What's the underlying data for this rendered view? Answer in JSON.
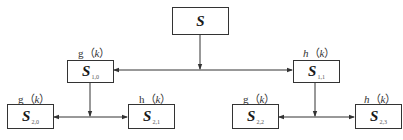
{
  "diagram": {
    "type": "wavelet-packet-decomposition-tree",
    "root": {
      "symbol": "S",
      "subscript": ""
    },
    "level1": [
      {
        "filter": "g",
        "arg": "k",
        "symbol": "S",
        "subscript": "1,0"
      },
      {
        "filter": "h",
        "arg": "k",
        "symbol": "S",
        "subscript": "1,1"
      }
    ],
    "level2": [
      {
        "filter": "g",
        "arg": "k",
        "symbol": "S",
        "subscript": "2,0"
      },
      {
        "filter": "h",
        "arg": "k",
        "symbol": "S",
        "subscript": "2,1"
      },
      {
        "filter": "g",
        "arg": "k",
        "symbol": "S",
        "subscript": "2,2"
      },
      {
        "filter": "h",
        "arg": "k",
        "symbol": "S",
        "subscript": "2,3"
      }
    ],
    "paren_open": "（",
    "paren_close": "）",
    "line_color": "#333333"
  }
}
